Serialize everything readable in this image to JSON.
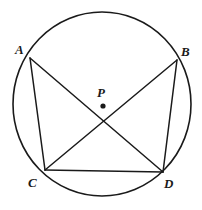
{
  "figure": {
    "type": "geometry-diagram",
    "background_color": "#ffffff",
    "stroke_color": "#1a1a1a",
    "canvas": {
      "width": 202,
      "height": 210
    },
    "circle": {
      "name": "circumscribed-circle",
      "center_x": 102,
      "center_y": 104,
      "radius_x": 89,
      "radius_y": 92,
      "stroke_width": 1.6
    },
    "center_point": {
      "label": "P",
      "label_x": 97,
      "label_y": 86,
      "dot_x": 103,
      "dot_y": 106,
      "dot_radius": 2.6
    },
    "vertices": [
      {
        "label": "A",
        "x": 30,
        "y": 58,
        "label_x": 15,
        "label_y": 43
      },
      {
        "label": "B",
        "x": 177,
        "y": 60,
        "label_x": 181,
        "label_y": 45
      },
      {
        "label": "C",
        "x": 45,
        "y": 170,
        "label_x": 28,
        "label_y": 176
      },
      {
        "label": "D",
        "x": 163,
        "y": 172,
        "label_x": 164,
        "label_y": 177
      }
    ],
    "segments": [
      {
        "name": "chord-AC",
        "from": "A",
        "to": "C",
        "x1": 30,
        "y1": 58,
        "x2": 45,
        "y2": 170
      },
      {
        "name": "diagonal-AD",
        "from": "A",
        "to": "D",
        "x1": 30,
        "y1": 58,
        "x2": 163,
        "y2": 172
      },
      {
        "name": "diagonal-BC",
        "from": "B",
        "to": "C",
        "x1": 177,
        "y1": 60,
        "x2": 45,
        "y2": 170
      },
      {
        "name": "chord-BD",
        "from": "B",
        "to": "D",
        "x1": 177,
        "y1": 60,
        "x2": 163,
        "y2": 172
      },
      {
        "name": "chord-CD",
        "from": "C",
        "to": "D",
        "x1": 45,
        "y1": 170,
        "x2": 163,
        "y2": 172
      }
    ],
    "segment_stroke_width": 1.5
  }
}
